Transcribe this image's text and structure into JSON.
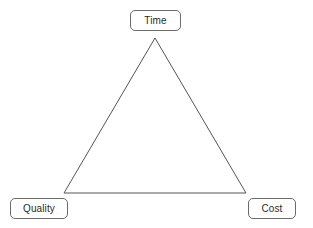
{
  "diagram": {
    "type": "triangle-diagram",
    "background_color": "#ffffff",
    "stroke_color": "#555555",
    "stroke_width": 1,
    "node_border_color": "#6b6b6b",
    "node_text_color": "#2b2b2b",
    "nodes": [
      {
        "id": "time",
        "label": "Time",
        "position": "apex-top"
      },
      {
        "id": "quality",
        "label": "Quality",
        "position": "bottom-left"
      },
      {
        "id": "cost",
        "label": "Cost",
        "position": "bottom-right"
      }
    ],
    "shape": {
      "vertices": [
        {
          "name": "apex",
          "x": 155,
          "y": 38
        },
        {
          "name": "bottom-left",
          "x": 64,
          "y": 193
        },
        {
          "name": "bottom-right",
          "x": 246,
          "y": 193
        }
      ],
      "points": "155,38 64,193 246,193",
      "filled": false
    }
  }
}
